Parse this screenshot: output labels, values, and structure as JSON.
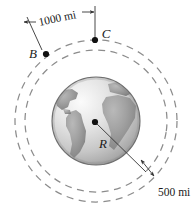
{
  "figure": {
    "background_color": "#ffffff",
    "width": 192,
    "height": 218
  },
  "labels": {
    "point_b": "B",
    "point_c": "C",
    "radius": "R",
    "arc_distance": "1000 mi",
    "altitude_distance": "500 mi"
  },
  "geometry": {
    "earth": {
      "center_x": 96,
      "center_y": 121,
      "radius": 44,
      "fill_light": "#f2f2f2",
      "fill_mid": "#c9c9c9",
      "fill_land": "#9a9a9a",
      "outline": "#6f6f6f"
    },
    "orbit_inner": {
      "center_x": 96,
      "center_y": 121,
      "radius": 71,
      "style": "dashed",
      "color": "#8c8c8c"
    },
    "orbit_outer": {
      "center_x": 96,
      "center_y": 121,
      "radius": 81,
      "style": "dashed",
      "color": "#8c8c8c"
    },
    "point_b": {
      "x": 46,
      "y": 54
    },
    "point_c": {
      "x": 95,
      "y": 40
    },
    "center_point": {
      "x": 95,
      "y": 122
    },
    "marker_color": "#111111",
    "leader_color": "#333333"
  }
}
